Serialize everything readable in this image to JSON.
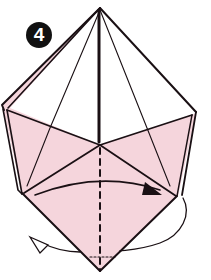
{
  "diagram": {
    "type": "origami-fold-step",
    "step_number": "4",
    "colors": {
      "paper_pink": "#f5d5dc",
      "paper_white": "#ffffff",
      "line": "#1a1014",
      "badge_bg": "#111111",
      "badge_text": "#ffffff"
    },
    "elements": {
      "fold_arrow": "valley-fold arrow (left to right)",
      "turn_over_arrow": "turn-over arrow around bottom",
      "crease": "vertical dashed valley line"
    }
  }
}
